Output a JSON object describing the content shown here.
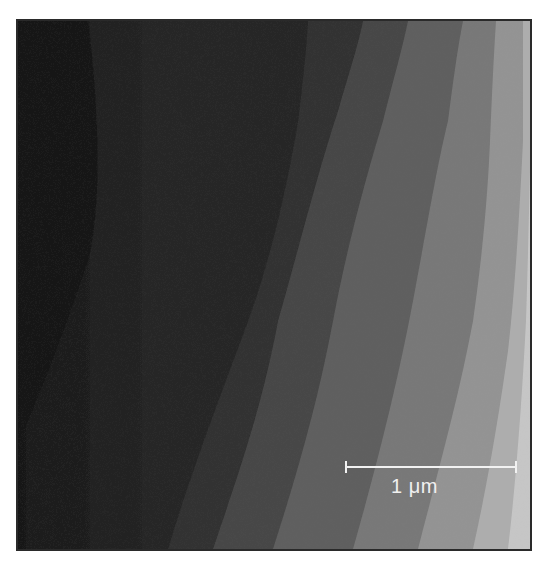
{
  "image": {
    "description": "Grayscale scanning-probe micrograph showing parallel terrace steps, dark on the left, progressively lighter towards the right",
    "scale_bar": {
      "label": "1 μm",
      "color": "#f2f2f2"
    },
    "terrace_colors": [
      "#1c1c1c",
      "#2a2a2a",
      "#3f3f3f",
      "#5a5a5a",
      "#737373",
      "#8e8e8e",
      "#a9a9a9",
      "#c4c4c4"
    ]
  }
}
